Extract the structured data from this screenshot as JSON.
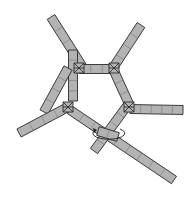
{
  "diagram": {
    "title": "",
    "colors": {
      "bar_fill": "#b3b3b3",
      "bar_stroke": "#2a2a2a",
      "segment_line": "#6a6a6a",
      "background": "#ffffff"
    },
    "bar_width": 9,
    "bars": [
      {
        "id": "bar-upper-left-arm",
        "x1": 51,
        "y1": 17,
        "x2": 82,
        "y2": 66,
        "segments": 4
      },
      {
        "id": "bar-vertical",
        "x1": 73,
        "y1": 50,
        "x2": 73,
        "y2": 101,
        "segments": 5
      },
      {
        "id": "bar-top-edge",
        "x1": 79,
        "y1": 69,
        "x2": 114,
        "y2": 69,
        "segments": 3
      },
      {
        "id": "bar-upper-right-arm",
        "x1": 141,
        "y1": 25,
        "x2": 113,
        "y2": 68,
        "segments": 4
      },
      {
        "id": "bar-right-edge",
        "x1": 114,
        "y1": 71,
        "x2": 129,
        "y2": 104,
        "segments": 3
      },
      {
        "id": "bar-right-arm",
        "x1": 130,
        "y1": 109,
        "x2": 183,
        "y2": 110,
        "segments": 5
      },
      {
        "id": "bar-left-edge",
        "x1": 44,
        "y1": 112,
        "x2": 68,
        "y2": 68,
        "segments": 4
      },
      {
        "id": "bar-left-arm",
        "x1": 19,
        "y1": 133,
        "x2": 68,
        "y2": 107,
        "segments": 4
      },
      {
        "id": "bar-long-diagonal",
        "x1": 70,
        "y1": 110,
        "x2": 174,
        "y2": 180,
        "segments": 9
      },
      {
        "id": "bar-lower-edge",
        "x1": 127,
        "y1": 106,
        "x2": 94,
        "y2": 151,
        "segments": 5
      },
      {
        "id": "bar-short-link",
        "x1": 98,
        "y1": 131,
        "x2": 118,
        "y2": 137,
        "segments": 2
      }
    ],
    "joints": [
      {
        "id": "joint-top-left",
        "x": 79,
        "y": 68
      },
      {
        "id": "joint-top-right",
        "x": 114,
        "y": 68
      },
      {
        "id": "joint-right",
        "x": 129,
        "y": 107
      },
      {
        "id": "joint-left",
        "x": 68,
        "y": 107
      }
    ],
    "rotation_indicator": {
      "id": "rotation-arrow",
      "cx": 110,
      "cy": 134,
      "rx": 16,
      "ry": 6,
      "direction": "counterclockwise"
    }
  }
}
